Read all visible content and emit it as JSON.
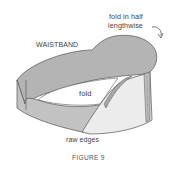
{
  "figure": {
    "caption": "FIGURE 9",
    "labels": {
      "fold_in_half_line1": "fold in half",
      "fold_in_half_line2": "lengthwise",
      "waistband": "WAISTBAND",
      "fold": "fold",
      "raw_edges": "raw edges"
    },
    "colors": {
      "band_outer": "#bdbdbd",
      "band_top": "#a9a9a9",
      "band_inner_light": "#eeeeee",
      "outline": "#555555",
      "background": "#ffffff"
    }
  }
}
